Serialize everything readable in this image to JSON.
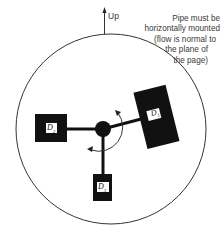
{
  "diagram": {
    "up_label": "Up",
    "note_lines": [
      "Pipe must be",
      "horizontally mounted",
      "(flow is normal to",
      "the plane of",
      "the page)"
    ],
    "detectors": [
      {
        "id": "D1",
        "label": "D",
        "sub": "1"
      },
      {
        "id": "D2",
        "label": "D",
        "sub": "2"
      },
      {
        "id": "D3",
        "label": "D",
        "sub": "3"
      }
    ],
    "colors": {
      "ink": "#111111",
      "line": "#333333",
      "text": "#3a3a3a"
    }
  }
}
